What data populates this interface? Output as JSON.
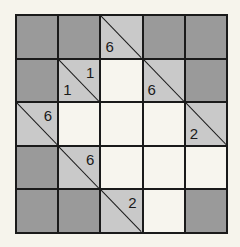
{
  "puzzle": {
    "type": "kakuro",
    "rows": 5,
    "cols": 5,
    "cells": [
      [
        {
          "t": "block"
        },
        {
          "t": "block"
        },
        {
          "t": "clue",
          "down": "6",
          "across": ""
        },
        {
          "t": "block"
        },
        {
          "t": "block"
        }
      ],
      [
        {
          "t": "block"
        },
        {
          "t": "clue",
          "down": "1",
          "across": "1"
        },
        {
          "t": "white"
        },
        {
          "t": "clue",
          "down": "6",
          "across": ""
        },
        {
          "t": "block"
        }
      ],
      [
        {
          "t": "clue",
          "down": "",
          "across": "6"
        },
        {
          "t": "white"
        },
        {
          "t": "white"
        },
        {
          "t": "white"
        },
        {
          "t": "clue",
          "down": "2",
          "across": ""
        }
      ],
      [
        {
          "t": "block"
        },
        {
          "t": "clue",
          "down": "",
          "across": "6"
        },
        {
          "t": "white"
        },
        {
          "t": "white"
        },
        {
          "t": "white"
        }
      ],
      [
        {
          "t": "block"
        },
        {
          "t": "block"
        },
        {
          "t": "clue",
          "down": "",
          "across": "2"
        },
        {
          "t": "white"
        },
        {
          "t": "block"
        }
      ]
    ]
  },
  "colors": {
    "block": "#9a9a9a",
    "clue": "#c9c9c9",
    "white": "#f7f5ee",
    "line": "#1a1a1a"
  }
}
